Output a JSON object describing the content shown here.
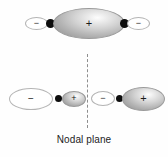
{
  "figure": {
    "caption": "Nodal plane",
    "background_color": "#fefefe",
    "line_color": "#8e8e8e",
    "nucleus_color": "#0d0d0d",
    "text_color": "#1c1c1c"
  },
  "top_row": {
    "description": "bonding combination: one large central positive lobe with two small negative end lobes",
    "lobes": [
      {
        "id": "top-left-minus",
        "sign": "−",
        "phase": "negative",
        "shading": "light"
      },
      {
        "id": "top-center-plus",
        "sign": "+",
        "phase": "positive",
        "shading": "shaded"
      },
      {
        "id": "top-right-minus",
        "sign": "−",
        "phase": "negative",
        "shading": "light"
      }
    ],
    "nuclei": 2
  },
  "bottom_row": {
    "description": "antibonding combination split by the nodal plane",
    "lobes": [
      {
        "id": "bottom-left-minus",
        "sign": "−",
        "phase": "negative",
        "shading": "light"
      },
      {
        "id": "bottom-left-plus",
        "sign": "+",
        "phase": "positive",
        "shading": "shaded"
      },
      {
        "id": "bottom-right-minus",
        "sign": "−",
        "phase": "negative",
        "shading": "light"
      },
      {
        "id": "bottom-right-plus",
        "sign": "+",
        "phase": "positive",
        "shading": "shaded"
      }
    ],
    "nuclei": 2
  },
  "nodal_plane": {
    "label": "Nodal plane",
    "style": "dashed-vertical"
  }
}
